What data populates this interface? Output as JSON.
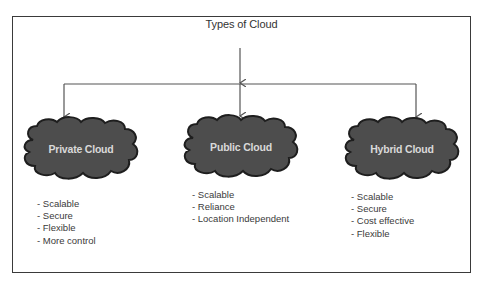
{
  "diagram": {
    "title": "Types of Cloud",
    "colors": {
      "frame": "#3a3a3a",
      "connector": "#555555",
      "cloud_fill": "#4d4d4d",
      "cloud_outline": "#1e1e1e",
      "cloud_text": "#d9d9d9",
      "text": "#333333"
    },
    "clouds": [
      {
        "label": "Private Cloud",
        "features": [
          "- Scalable",
          "- Secure",
          "- Flexible",
          "- More control"
        ]
      },
      {
        "label": "Public Cloud",
        "features": [
          "- Scalable",
          "- Reliance",
          "- Location Independent"
        ]
      },
      {
        "label": "Hybrid Cloud",
        "features": [
          "- Scalable",
          "- Secure",
          "- Cost effective",
          "- Flexible"
        ]
      }
    ]
  }
}
